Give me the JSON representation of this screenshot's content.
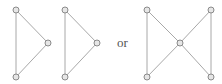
{
  "diagram": {
    "type": "graph-drawings",
    "separator_label": "or",
    "colors": {
      "edge": "#a8a8a8",
      "node_fill": "#e6e6e6",
      "node_stroke": "#8a8a8a",
      "text": "#555555"
    },
    "graphs": [
      {
        "name": "triangle-1",
        "nodes": [
          {
            "id": "a",
            "x": 16,
            "y": 10
          },
          {
            "id": "b",
            "x": 48,
            "y": 43
          },
          {
            "id": "c",
            "x": 16,
            "y": 77
          }
        ],
        "edges": [
          [
            "a",
            "b"
          ],
          [
            "b",
            "c"
          ],
          [
            "a",
            "c"
          ]
        ]
      },
      {
        "name": "triangle-2",
        "nodes": [
          {
            "id": "a",
            "x": 65,
            "y": 10
          },
          {
            "id": "b",
            "x": 97,
            "y": 43
          },
          {
            "id": "c",
            "x": 65,
            "y": 77
          }
        ],
        "edges": [
          [
            "a",
            "b"
          ],
          [
            "b",
            "c"
          ],
          [
            "a",
            "c"
          ]
        ]
      },
      {
        "name": "bowtie",
        "nodes": [
          {
            "id": "tl",
            "x": 147,
            "y": 10
          },
          {
            "id": "tr",
            "x": 211,
            "y": 10
          },
          {
            "id": "m",
            "x": 180,
            "y": 43
          },
          {
            "id": "bl",
            "x": 147,
            "y": 77
          },
          {
            "id": "br",
            "x": 211,
            "y": 77
          }
        ],
        "edges": [
          [
            "tl",
            "m"
          ],
          [
            "tr",
            "m"
          ],
          [
            "bl",
            "m"
          ],
          [
            "br",
            "m"
          ],
          [
            "tl",
            "bl"
          ],
          [
            "tr",
            "br"
          ]
        ]
      }
    ]
  }
}
